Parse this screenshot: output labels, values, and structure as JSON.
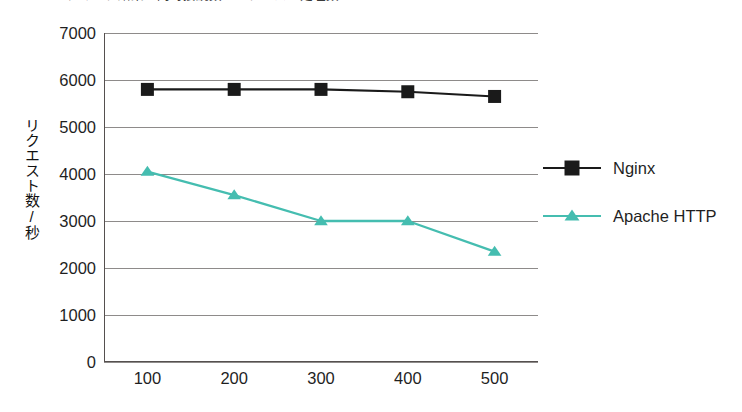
{
  "chart_data": {
    "type": "line",
    "title": "ベンチマーク結果：同時接続数とリクエスト処理数",
    "title_clipped": true,
    "subtitle": "",
    "xlabel": "",
    "ylabel": "リクエスト数/秒",
    "x": [
      100,
      200,
      300,
      400,
      500
    ],
    "categories": [
      "100",
      "200",
      "300",
      "400",
      "500"
    ],
    "xtick_labels": [
      "100",
      "200",
      "300",
      "400",
      "500"
    ],
    "ytick_labels": [
      "7000",
      "6000",
      "5000",
      "4000",
      "3000",
      "2000",
      "1000",
      "0"
    ],
    "ytick_values": [
      7000,
      6000,
      5000,
      4000,
      3000,
      2000,
      1000,
      0
    ],
    "ylim": [
      0,
      7000
    ],
    "grid": true,
    "grid_axis": "y",
    "legend_position": "right",
    "series": [
      {
        "name": "Nginx",
        "color": "#1a1a1a",
        "marker": "square",
        "values": [
          5800,
          5800,
          5800,
          5750,
          5650
        ]
      },
      {
        "name": "Apache HTTP",
        "color": "#45bdb0",
        "marker": "triangle",
        "values": [
          4050,
          3550,
          3000,
          3000,
          2350
        ]
      }
    ]
  },
  "legend": {
    "items": [
      {
        "label": "Nginx"
      },
      {
        "label": "Apache HTTP"
      }
    ]
  },
  "colors": {
    "nginx": "#1a1a1a",
    "apache": "#45bdb0",
    "gridline": "#8e8b8a",
    "axis": "#55504f",
    "background": "#ffffff"
  }
}
